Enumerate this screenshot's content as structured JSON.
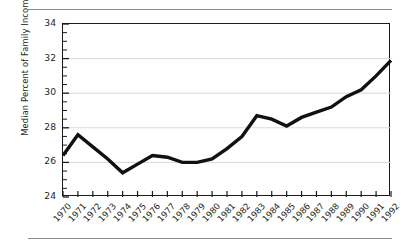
{
  "chart_data": {
    "type": "line",
    "title": "",
    "xlabel": "",
    "ylabel": "Median Percent of Family Income",
    "x": [
      1970,
      1971,
      1972,
      1973,
      1974,
      1975,
      1976,
      1977,
      1978,
      1979,
      1980,
      1981,
      1982,
      1983,
      1984,
      1985,
      1986,
      1987,
      1988,
      1989,
      1990,
      1991,
      1992
    ],
    "categories": [
      "1970",
      "1971",
      "1972",
      "1973",
      "1974",
      "1975",
      "1976",
      "1977",
      "1978",
      "1979",
      "1980",
      "1981",
      "1982",
      "1983",
      "1984",
      "1985",
      "1986",
      "1987",
      "1988",
      "1989",
      "1990",
      "1991",
      "1992"
    ],
    "values": [
      26.4,
      27.6,
      26.9,
      26.2,
      25.4,
      25.9,
      26.4,
      26.3,
      26.0,
      26.0,
      26.2,
      26.8,
      27.5,
      28.7,
      28.5,
      28.1,
      28.6,
      28.9,
      29.2,
      29.8,
      30.2,
      31.0,
      31.9
    ],
    "series": [
      {
        "name": "Median Percent of Family Income",
        "values": [
          26.4,
          27.6,
          26.9,
          26.2,
          25.4,
          25.9,
          26.4,
          26.3,
          26.0,
          26.0,
          26.2,
          26.8,
          27.5,
          28.7,
          28.5,
          28.1,
          28.6,
          28.9,
          29.2,
          29.8,
          30.2,
          31.0,
          31.9
        ]
      }
    ],
    "ylim": [
      24,
      34
    ],
    "yticks": [
      24,
      26,
      28,
      30,
      32,
      34
    ],
    "ytick_labels": [
      "24",
      "26",
      "28",
      "30",
      "32",
      "34"
    ],
    "y_minor_step": 0.5,
    "xlim": [
      1970,
      1992
    ],
    "grid": "horizontal",
    "grid_color": "#d9d9d9",
    "line_color": "#111111",
    "line_width": 3.4,
    "legend": "none",
    "xtick_rotation": -47,
    "annotations": []
  },
  "figure": {
    "top_rule": "",
    "bottom_rule": "",
    "background": "#ffffff",
    "frame_color": "#1a1a1a"
  }
}
